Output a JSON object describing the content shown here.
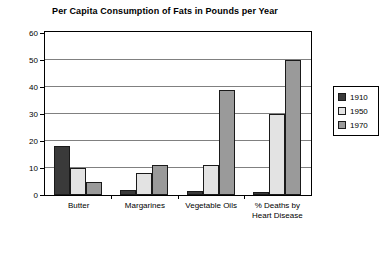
{
  "chart_data": {
    "type": "bar",
    "title": "Per Capita Consumption of Fats in Pounds per Year",
    "xlabel": "",
    "ylabel": "",
    "ylim": [
      0,
      60
    ],
    "yticks": [
      0,
      10,
      20,
      30,
      40,
      50,
      60
    ],
    "grid": true,
    "legend_position": "right",
    "categories": [
      "Butter",
      "Margarines",
      "Vegetable Oils",
      "% Deaths by\nHeart Disease"
    ],
    "series": [
      {
        "name": "1910",
        "color": "#3a3a3a",
        "values": [
          18,
          2,
          1.5,
          1
        ]
      },
      {
        "name": "1950",
        "color": "#e3e3e3",
        "values": [
          10,
          8,
          11,
          30
        ]
      },
      {
        "name": "1970",
        "color": "#9a9a9a",
        "values": [
          5,
          11,
          39,
          50
        ]
      }
    ]
  },
  "axis": {
    "tick_labels": [
      "60",
      "50",
      "40",
      "30",
      "20",
      "10",
      "0"
    ]
  },
  "categories_display": [
    {
      "line1": "Butter",
      "line2": ""
    },
    {
      "line1": "Margarines",
      "line2": ""
    },
    {
      "line1": "Vegetable Oils",
      "line2": ""
    },
    {
      "line1": "% Deaths by",
      "line2": "Heart Disease"
    }
  ],
  "legend": {
    "items": [
      {
        "label": "1910"
      },
      {
        "label": "1950"
      },
      {
        "label": "1970"
      }
    ]
  }
}
